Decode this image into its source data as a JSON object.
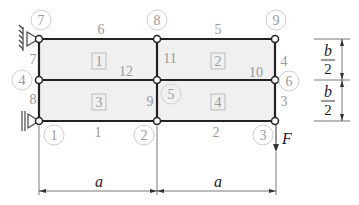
{
  "diagram": {
    "type": "fem-mesh-cantilever",
    "colors": {
      "member": "#222222",
      "label": "#9a9a9a",
      "panel": "#f0f0f0",
      "dimension": "#333333"
    },
    "nodes": [
      {
        "id": "1",
        "label": "1"
      },
      {
        "id": "2",
        "label": "2"
      },
      {
        "id": "3",
        "label": "3"
      },
      {
        "id": "4",
        "label": "4"
      },
      {
        "id": "5",
        "label": "5"
      },
      {
        "id": "6",
        "label": "6"
      },
      {
        "id": "7",
        "label": "7"
      },
      {
        "id": "8",
        "label": "8"
      },
      {
        "id": "9",
        "label": "9"
      }
    ],
    "edges": [
      {
        "label": "1"
      },
      {
        "label": "2"
      },
      {
        "label": "3"
      },
      {
        "label": "4"
      },
      {
        "label": "5"
      },
      {
        "label": "6"
      },
      {
        "label": "7"
      },
      {
        "label": "8"
      },
      {
        "label": "9"
      },
      {
        "label": "10"
      },
      {
        "label": "11"
      },
      {
        "label": "12"
      }
    ],
    "elements": [
      {
        "label": "1"
      },
      {
        "label": "2"
      },
      {
        "label": "3"
      },
      {
        "label": "4"
      }
    ],
    "load": {
      "label": "F"
    },
    "dimensions": {
      "horizontal": [
        {
          "label": "a"
        },
        {
          "label": "a"
        }
      ],
      "vertical": [
        {
          "num": "b",
          "den": "2"
        },
        {
          "num": "b",
          "den": "2"
        }
      ]
    }
  }
}
